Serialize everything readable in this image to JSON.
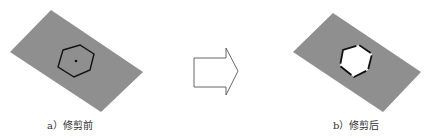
{
  "figure": {
    "colors": {
      "plate": "#8f8f8f",
      "outline": "#111111",
      "hole": "#ffffff",
      "arrow_stroke": "#555555",
      "background": "#ffffff"
    },
    "panels": [
      {
        "id": "a",
        "caption": "a）修剪前",
        "state": "hexagon outline drawn on plate with center point"
      },
      {
        "id": "b",
        "caption": "b）修剪后",
        "state": "hexagonal hole trimmed out of plate"
      }
    ],
    "arrow": {
      "direction": "right",
      "icon": "block-arrow-right-icon"
    }
  }
}
